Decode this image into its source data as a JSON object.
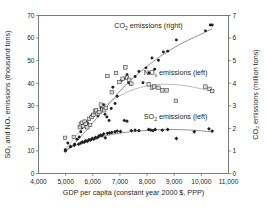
{
  "chart_data": {
    "type": "scatter",
    "title": "",
    "xlabel": "GDP per capita (constant year 2000 $, PPP)",
    "ylabel_left": "SO₂ and NOₓ emissions (thousand tons)",
    "ylabel_right": "CO₂ emissions (million tons)",
    "xlim": [
      4000,
      11000
    ],
    "xticks": [
      4000,
      5000,
      6000,
      7000,
      8000,
      9000,
      10000,
      11000
    ],
    "xticklabels": [
      "4,000",
      "5,000",
      "6,000",
      "7,000",
      "8,000",
      "9,000",
      "10,000",
      "11,000"
    ],
    "ylim_left": [
      0,
      70
    ],
    "yticks_left": [
      0,
      10,
      20,
      30,
      40,
      50,
      60,
      70
    ],
    "yticklabels_left": [
      "0",
      "10",
      "20",
      "30",
      "40",
      "50",
      "60",
      "70"
    ],
    "ylim_right": [
      0,
      7
    ],
    "yticks_right": [
      0,
      1,
      2,
      3,
      4,
      5,
      6,
      7
    ],
    "yticklabels_right": [
      "0",
      "1",
      "2",
      "3",
      "4",
      "5",
      "6",
      "7"
    ],
    "grid": false,
    "legend_position": "inline-annotations",
    "annotations": [
      {
        "name": "co2-label",
        "text_main": "CO",
        "text_sub": "2",
        "text_tail": " emissions (right)",
        "x": 8050,
        "y_left": 64.5
      },
      {
        "name": "nox-label",
        "text_main": "NO",
        "text_sub": "x",
        "text_tail": " emissions (left)",
        "x": 9050,
        "y_left": 43.5
      },
      {
        "name": "so2-label",
        "text_main": "SO",
        "text_sub": "2",
        "text_tail": " emissions (left)",
        "x": 9050,
        "y_left": 24.0
      }
    ],
    "series": [
      {
        "name": "CO₂ emissions (right)",
        "axis": "right",
        "marker": "filled-circle",
        "color": "#231f20",
        "unit": "million tons",
        "points": [
          [
            4990,
            1.05
          ],
          [
            5080,
            1.35
          ],
          [
            5180,
            1.18
          ],
          [
            5330,
            1.3
          ],
          [
            5420,
            1.52
          ],
          [
            5500,
            1.62
          ],
          [
            5560,
            1.85
          ],
          [
            5600,
            2.02
          ],
          [
            5640,
            2.12
          ],
          [
            5700,
            2.18
          ],
          [
            5760,
            2.3
          ],
          [
            5810,
            2.22
          ],
          [
            5870,
            2.4
          ],
          [
            5930,
            2.52
          ],
          [
            5980,
            2.62
          ],
          [
            6030,
            2.58
          ],
          [
            6080,
            2.72
          ],
          [
            6140,
            2.78
          ],
          [
            6190,
            2.55
          ],
          [
            6240,
            2.7
          ],
          [
            6300,
            2.9
          ],
          [
            6350,
            2.82
          ],
          [
            6400,
            3.05
          ],
          [
            6450,
            2.62
          ],
          [
            6520,
            2.5
          ],
          [
            6600,
            2.35
          ],
          [
            6680,
            2.88
          ],
          [
            6740,
            3.82
          ],
          [
            6820,
            3.1
          ],
          [
            6900,
            3.42
          ],
          [
            7050,
            4.12
          ],
          [
            7180,
            4.22
          ],
          [
            7260,
            4.38
          ],
          [
            7320,
            4.02
          ],
          [
            7400,
            3.95
          ],
          [
            7560,
            4.3
          ],
          [
            7700,
            4.52
          ],
          [
            7850,
            4.02
          ],
          [
            7960,
            4.68
          ],
          [
            8080,
            4.45
          ],
          [
            8180,
            5.12
          ],
          [
            8280,
            4.62
          ],
          [
            8420,
            5.02
          ],
          [
            8600,
            5.38
          ],
          [
            8760,
            5.42
          ],
          [
            9080,
            5.92
          ],
          [
            10150,
            6.32
          ],
          [
            10330,
            6.58
          ],
          [
            10400,
            6.58
          ]
        ]
      },
      {
        "name": "NOₓ emissions (left)",
        "axis": "left",
        "marker": "open-square",
        "color": "#d9d9d9",
        "unit": "thousand tons",
        "points": [
          [
            4980,
            15.8
          ],
          [
            5300,
            16.2
          ],
          [
            5520,
            20.5
          ],
          [
            5560,
            21.8
          ],
          [
            5600,
            22.5
          ],
          [
            5640,
            21.0
          ],
          [
            5700,
            23.0
          ],
          [
            5740,
            22.0
          ],
          [
            5800,
            20.5
          ],
          [
            5860,
            24.2
          ],
          [
            5900,
            21.5
          ],
          [
            5960,
            25.0
          ],
          [
            6020,
            26.0
          ],
          [
            6080,
            27.5
          ],
          [
            6120,
            28.0
          ],
          [
            6180,
            26.5
          ],
          [
            6240,
            27.2
          ],
          [
            6300,
            30.5
          ],
          [
            6360,
            28.5
          ],
          [
            6420,
            28.0
          ],
          [
            6480,
            29.0
          ],
          [
            6540,
            43.2
          ],
          [
            6700,
            36.0
          ],
          [
            6860,
            44.5
          ],
          [
            6980,
            40.5
          ],
          [
            7100,
            42.0
          ],
          [
            7200,
            47.0
          ],
          [
            7260,
            42.5
          ],
          [
            7340,
            41.5
          ],
          [
            7420,
            39.8
          ],
          [
            8060,
            39.5
          ],
          [
            8180,
            38.0
          ],
          [
            8260,
            38.5
          ],
          [
            8420,
            38.0
          ],
          [
            8560,
            36.8
          ],
          [
            8720,
            36.8
          ],
          [
            9060,
            32.2
          ],
          [
            10150,
            38.5
          ],
          [
            10300,
            37.5
          ],
          [
            10400,
            36.5
          ]
        ]
      },
      {
        "name": "SO₂ emissions (left)",
        "axis": "left",
        "marker": "filled-diamond",
        "color": "#231f20",
        "unit": "thousand tons",
        "points": [
          [
            4990,
            10.0
          ],
          [
            5180,
            12.0
          ],
          [
            5320,
            12.5
          ],
          [
            5480,
            13.0
          ],
          [
            5560,
            13.5
          ],
          [
            5620,
            14.0
          ],
          [
            5680,
            13.8
          ],
          [
            5740,
            14.5
          ],
          [
            5800,
            14.2
          ],
          [
            5860,
            15.0
          ],
          [
            5920,
            14.8
          ],
          [
            5980,
            15.5
          ],
          [
            6040,
            15.2
          ],
          [
            6100,
            16.0
          ],
          [
            6160,
            15.8
          ],
          [
            6220,
            16.5
          ],
          [
            6280,
            17.0
          ],
          [
            6340,
            16.8
          ],
          [
            6400,
            17.5
          ],
          [
            6460,
            15.8
          ],
          [
            6540,
            17.8
          ],
          [
            6620,
            18.0
          ],
          [
            6700,
            18.2
          ],
          [
            6820,
            18.5
          ],
          [
            6900,
            18.8
          ],
          [
            7020,
            18.6
          ],
          [
            7160,
            23.5
          ],
          [
            7260,
            23.2
          ],
          [
            7420,
            19.0
          ],
          [
            7560,
            19.2
          ],
          [
            7700,
            19.0
          ],
          [
            8060,
            19.5
          ],
          [
            8140,
            19.2
          ],
          [
            8220,
            19.0
          ],
          [
            8300,
            19.5
          ],
          [
            8560,
            19.2
          ],
          [
            8760,
            19.5
          ],
          [
            9080,
            15.5
          ],
          [
            9740,
            18.5
          ],
          [
            10280,
            19.8
          ],
          [
            10400,
            18.8
          ]
        ]
      }
    ],
    "trendlines": [
      {
        "name": "co2-trend",
        "axis": "right",
        "shape": "rising-saturating",
        "points": [
          [
            4990,
            0.95
          ],
          [
            5500,
            1.55
          ],
          [
            6000,
            2.25
          ],
          [
            6500,
            2.95
          ],
          [
            7000,
            3.65
          ],
          [
            7500,
            4.25
          ],
          [
            8000,
            4.75
          ],
          [
            8500,
            5.2
          ],
          [
            9000,
            5.58
          ],
          [
            9500,
            5.9
          ],
          [
            10000,
            6.18
          ],
          [
            10400,
            6.42
          ]
        ]
      },
      {
        "name": "nox-trend",
        "axis": "left",
        "shape": "inverted-u",
        "points": [
          [
            4990,
            10.5
          ],
          [
            5500,
            18.5
          ],
          [
            6000,
            25.0
          ],
          [
            6500,
            30.5
          ],
          [
            7000,
            34.5
          ],
          [
            7500,
            37.2
          ],
          [
            8000,
            38.8
          ],
          [
            8500,
            39.5
          ],
          [
            9000,
            39.4
          ],
          [
            9500,
            38.7
          ],
          [
            10000,
            37.5
          ],
          [
            10400,
            36.2
          ]
        ]
      },
      {
        "name": "so2-trend",
        "axis": "left",
        "shape": "inverted-u-flat",
        "points": [
          [
            4990,
            10.3
          ],
          [
            5500,
            13.2
          ],
          [
            6000,
            15.3
          ],
          [
            6500,
            16.8
          ],
          [
            7000,
            17.9
          ],
          [
            7500,
            18.6
          ],
          [
            8000,
            19.1
          ],
          [
            8500,
            19.4
          ],
          [
            9000,
            19.5
          ],
          [
            9500,
            19.3
          ],
          [
            10000,
            18.9
          ],
          [
            10400,
            18.4
          ]
        ]
      }
    ]
  }
}
